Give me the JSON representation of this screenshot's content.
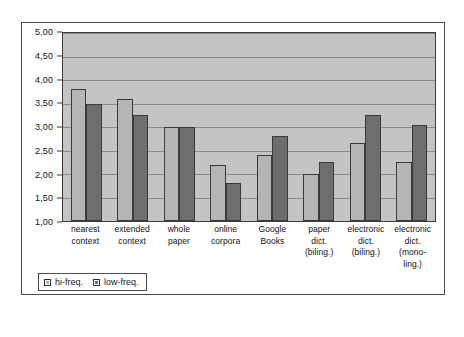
{
  "chart_data": {
    "type": "bar",
    "title": "",
    "xlabel": "",
    "ylabel": "",
    "ylim": [
      1.0,
      5.0
    ],
    "ytick_labels": [
      "5,00",
      "4,50",
      "4,00",
      "3,50",
      "3,00",
      "2,50",
      "2,00",
      "1,50",
      "1,00"
    ],
    "ytick_values": [
      5.0,
      4.5,
      4.0,
      3.5,
      3.0,
      2.5,
      2.0,
      1.5,
      1.0
    ],
    "grid": true,
    "legend_position": "bottom-left",
    "categories": [
      "nearest context",
      "extended context",
      "whole paper",
      "online corpora",
      "Google Books",
      "paper dict. (biling.)",
      "electronic dict. (biling.)",
      "electronic dict. (monoling.)"
    ],
    "category_lines": [
      [
        "nearest",
        "context"
      ],
      [
        "extended",
        "context"
      ],
      [
        "whole",
        "paper"
      ],
      [
        "online",
        "corpora"
      ],
      [
        "Google",
        "Books"
      ],
      [
        "paper",
        "dict.",
        "(biling.)"
      ],
      [
        "electronic",
        "dict.",
        "(biling.)"
      ],
      [
        "electronic",
        "dict.",
        "(mono-",
        "ling.)"
      ]
    ],
    "series": [
      {
        "name": "hi-freq.",
        "color": "#b5b5b5",
        "values": [
          3.8,
          3.6,
          3.0,
          2.2,
          2.4,
          2.0,
          2.65,
          2.25
        ]
      },
      {
        "name": "low-freq.",
        "color": "#6e6e6e",
        "values": [
          3.5,
          3.25,
          3.0,
          1.8,
          2.8,
          2.25,
          3.25,
          3.05
        ]
      }
    ]
  },
  "legend": {
    "items": [
      {
        "label": "hi-freq."
      },
      {
        "label": "low-freq."
      }
    ]
  },
  "colors": {
    "plot_background": "#c4c4c4",
    "gridline": "#8a8a8a",
    "axis": "#3a3a3a",
    "hi_freq": "#b5b5b5",
    "low_freq": "#6e6e6e"
  }
}
